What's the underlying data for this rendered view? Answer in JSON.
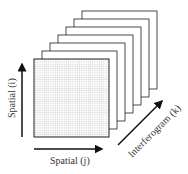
{
  "diagram": {
    "frame_count": 7,
    "front_frame": {
      "pattern": "grid"
    },
    "axes": {
      "vertical": {
        "label": "Spatial (i)"
      },
      "horizontal": {
        "label": "Spatial (j)"
      },
      "depth": {
        "label": "Interferogram (k)"
      }
    },
    "colors": {
      "stroke": "#222222",
      "grid": "#c8c8c8",
      "background": "#ffffff"
    }
  }
}
